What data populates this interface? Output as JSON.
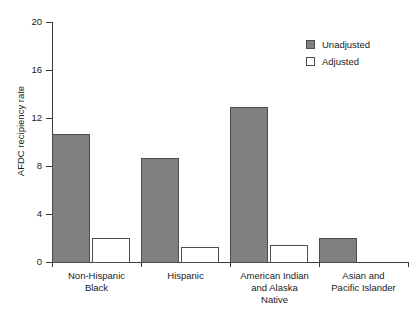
{
  "chart_data": {
    "type": "bar",
    "title": "",
    "xlabel": "",
    "ylabel": "AFDC recipiency rate",
    "ylim": [
      0,
      20
    ],
    "yticks": [
      0,
      4,
      8,
      12,
      16,
      20
    ],
    "ytick_labels": [
      "0",
      "4",
      "8",
      "12",
      "16",
      "20"
    ],
    "grid": false,
    "legend_position": "top-right",
    "categories": [
      "Non-Hispanic Black",
      "Hispanic",
      "American Indian and Alaska Native",
      "Asian and Pacific Islander"
    ],
    "category_lines": [
      [
        "Non-Hispanic",
        "Black"
      ],
      [
        "Hispanic"
      ],
      [
        "American Indian",
        "and Alaska",
        "Native"
      ],
      [
        "Asian and",
        "Pacific Islander"
      ]
    ],
    "series": [
      {
        "name": "Unadjusted",
        "color": "#808080",
        "values": [
          10.7,
          8.7,
          12.9,
          2.0
        ]
      },
      {
        "name": "Adjusted",
        "color": "#ffffff",
        "values": [
          2.0,
          1.25,
          1.4,
          0
        ]
      }
    ]
  },
  "legend": {
    "items": [
      {
        "label": "Unadjusted",
        "style": "unadjusted"
      },
      {
        "label": "Adjusted",
        "style": "adjusted"
      }
    ]
  },
  "colors": {
    "unadjusted_fill": "#808080",
    "adjusted_fill": "#ffffff",
    "bar_edge": "#4d4d4d",
    "axis": "#3a3a3a",
    "text": "#1a1a1a",
    "background": "#ffffff"
  }
}
